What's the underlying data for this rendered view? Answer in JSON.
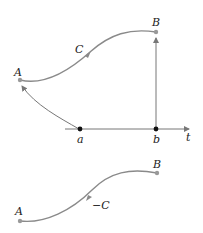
{
  "diagram": {
    "top": {
      "point_start": "A",
      "point_end": "B",
      "curve_label": "C",
      "axis_label": "t",
      "tick_a": "a",
      "tick_b": "b"
    },
    "bottom": {
      "point_start": "A",
      "point_end": "B",
      "curve_label": "−C"
    },
    "colors": {
      "curve": "#8a8a8a",
      "axis": "#777777",
      "dot": "#111111",
      "text": "#222222"
    }
  }
}
